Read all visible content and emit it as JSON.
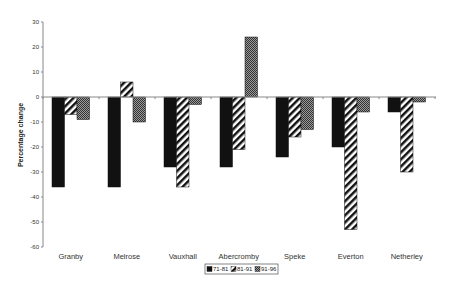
{
  "chart_data": {
    "type": "bar",
    "title": "",
    "xlabel": "",
    "ylabel": "Percentage change",
    "ylim": [
      -60,
      30
    ],
    "yticks": [
      30,
      20,
      10,
      0,
      -10,
      -20,
      -30,
      -40,
      -50,
      -60
    ],
    "grid": false,
    "legend_position": "bottom",
    "categories": [
      "Granby",
      "Melrose",
      "Vauxhall",
      "Abercromby",
      "Speke",
      "Everton",
      "Netherley"
    ],
    "series": [
      {
        "name": "71-81",
        "pattern": "solid-black",
        "values": [
          -36,
          -36,
          -28,
          -28,
          -24,
          -20,
          -6
        ]
      },
      {
        "name": "81-91",
        "pattern": "diagonal-stripes",
        "values": [
          -7,
          6,
          -36,
          -21,
          -16,
          -53,
          -30
        ]
      },
      {
        "name": "91-96",
        "pattern": "crosshatch",
        "values": [
          -9,
          -10,
          -3,
          24,
          -13,
          -6,
          -2
        ]
      }
    ]
  },
  "colors": {
    "series_71_81": "#111111",
    "stripe": "#111111",
    "crosshatch": "#444444",
    "axis": "#888888"
  }
}
